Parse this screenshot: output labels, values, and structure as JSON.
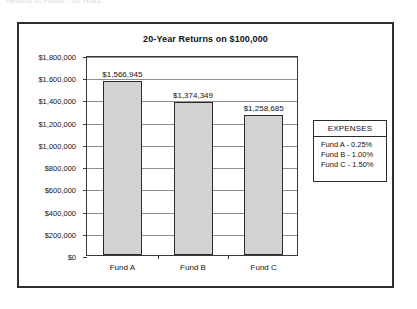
{
  "page": {
    "cut_off_header": "Returns of Funds - 20 Years"
  },
  "chart_data": {
    "type": "bar",
    "title": "20-Year Returns on $100,000",
    "xlabel": "",
    "ylabel": "",
    "categories": [
      "Fund A",
      "Fund B",
      "Fund C"
    ],
    "values": [
      1566945,
      1374349,
      1258685
    ],
    "value_labels": [
      "$1,566,945",
      "$1,374,349",
      "$1,258,685"
    ],
    "ylim": [
      0,
      1800000
    ],
    "ytick_values": [
      0,
      200000,
      400000,
      600000,
      800000,
      1000000,
      1200000,
      1400000,
      1600000,
      1800000
    ],
    "ytick_labels": [
      "$0",
      "$200,000",
      "$400,000",
      "$600,000",
      "$800,000",
      "$1,000,000",
      "$1,200,000",
      "$1,400,000",
      "$1,600,000",
      "$1,800,000"
    ],
    "grid": true,
    "legend_position": "right-outside",
    "bar_color": "#d2d2d2",
    "bar_border_color": "#2b2b2b",
    "grid_color": "#8e8e8e"
  },
  "legend": {
    "title": "EXPENSES",
    "rows": [
      "Fund A - 0.25%",
      "Fund B - 1.00%",
      "Fund C - 1.50%"
    ]
  }
}
